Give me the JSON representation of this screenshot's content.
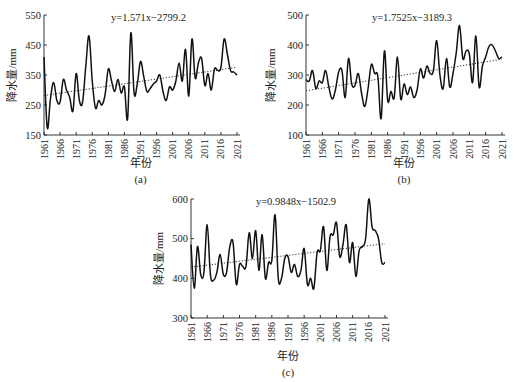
{
  "chart_data": [
    {
      "id": "a",
      "type": "line",
      "caption": "(a)",
      "equation": "y=1.571x−2799.2",
      "xlabel": "年份",
      "ylabel": "降水量/mm",
      "xlim": [
        1961,
        2021
      ],
      "ylim": [
        150,
        550
      ],
      "yticks": [
        150,
        250,
        350,
        450,
        550
      ],
      "xticks": [
        1961,
        1966,
        1971,
        1976,
        1981,
        1986,
        1991,
        1996,
        2001,
        2006,
        2011,
        2016,
        2021
      ],
      "trend": {
        "slope": 1.571,
        "intercept": -2799.2,
        "style": "dotted"
      },
      "x": [
        1961,
        1962,
        1963,
        1964,
        1965,
        1966,
        1967,
        1968,
        1969,
        1970,
        1971,
        1972,
        1973,
        1974,
        1975,
        1976,
        1977,
        1978,
        1979,
        1980,
        1981,
        1982,
        1983,
        1984,
        1985,
        1986,
        1987,
        1988,
        1989,
        1990,
        1991,
        1992,
        1993,
        1994,
        1995,
        1996,
        1997,
        1998,
        1999,
        2000,
        2001,
        2002,
        2003,
        2004,
        2005,
        2006,
        2007,
        2008,
        2009,
        2010,
        2011,
        2012,
        2013,
        2014,
        2015,
        2016,
        2017,
        2018,
        2019,
        2020,
        2021
      ],
      "values": [
        410,
        175,
        270,
        325,
        265,
        260,
        335,
        300,
        275,
        230,
        355,
        265,
        260,
        380,
        480,
        330,
        240,
        265,
        250,
        285,
        370,
        330,
        295,
        335,
        290,
        310,
        205,
        490,
        290,
        320,
        395,
        345,
        295,
        305,
        320,
        330,
        350,
        295,
        265,
        310,
        300,
        330,
        390,
        330,
        435,
        280,
        470,
        340,
        390,
        405,
        315,
        355,
        300,
        370,
        365,
        375,
        470,
        420,
        365,
        360,
        350
      ]
    },
    {
      "id": "b",
      "type": "line",
      "caption": "(b)",
      "equation": "y=1.7525x−3189.3",
      "xlabel": "年份",
      "ylabel": "降水量/mm",
      "xlim": [
        1961,
        2021
      ],
      "ylim": [
        100,
        500
      ],
      "yticks": [
        100,
        200,
        300,
        400,
        500
      ],
      "xticks": [
        1961,
        1966,
        1971,
        1976,
        1981,
        1986,
        1991,
        1996,
        2001,
        2006,
        2011,
        2016,
        2021
      ],
      "trend": {
        "slope": 1.7525,
        "intercept": -3189.3,
        "style": "dotted"
      },
      "x": [
        1961,
        1962,
        1963,
        1964,
        1965,
        1966,
        1967,
        1968,
        1969,
        1970,
        1971,
        1972,
        1973,
        1974,
        1975,
        1976,
        1977,
        1978,
        1979,
        1980,
        1981,
        1982,
        1983,
        1984,
        1985,
        1986,
        1987,
        1988,
        1989,
        1990,
        1991,
        1992,
        1993,
        1994,
        1995,
        1996,
        1997,
        1998,
        1999,
        2000,
        2001,
        2002,
        2003,
        2004,
        2005,
        2006,
        2007,
        2008,
        2009,
        2010,
        2011,
        2012,
        2013,
        2014,
        2015,
        2016,
        2017,
        2018,
        2019,
        2020,
        2021
      ],
      "values": [
        285,
        280,
        315,
        255,
        280,
        275,
        315,
        260,
        220,
        250,
        310,
        315,
        225,
        355,
        270,
        265,
        305,
        240,
        195,
        255,
        335,
        305,
        295,
        155,
        380,
        215,
        245,
        225,
        360,
        220,
        270,
        235,
        260,
        225,
        250,
        320,
        290,
        330,
        305,
        315,
        415,
        300,
        255,
        355,
        260,
        305,
        375,
        465,
        355,
        380,
        370,
        275,
        430,
        260,
        330,
        360,
        395,
        400,
        380,
        355,
        360
      ]
    },
    {
      "id": "c",
      "type": "line",
      "caption": "(c)",
      "equation": "y=0.9848x−1502.9",
      "xlabel": "年份",
      "ylabel": "降水量/mm",
      "xlim": [
        1961,
        2021
      ],
      "ylim": [
        300,
        600
      ],
      "yticks": [
        300,
        400,
        500,
        600
      ],
      "xticks": [
        1961,
        1966,
        1971,
        1976,
        1981,
        1986,
        1991,
        1996,
        2001,
        2006,
        2011,
        2016,
        2021
      ],
      "trend": {
        "slope": 0.9848,
        "intercept": -1502.9,
        "style": "dotted"
      },
      "x": [
        1961,
        1962,
        1963,
        1964,
        1965,
        1966,
        1967,
        1968,
        1969,
        1970,
        1971,
        1972,
        1973,
        1974,
        1975,
        1976,
        1977,
        1978,
        1979,
        1980,
        1981,
        1982,
        1983,
        1984,
        1985,
        1986,
        1987,
        1988,
        1989,
        1990,
        1991,
        1992,
        1993,
        1994,
        1995,
        1996,
        1997,
        1998,
        1999,
        2000,
        2001,
        2002,
        2003,
        2004,
        2005,
        2006,
        2007,
        2008,
        2009,
        2010,
        2011,
        2012,
        2013,
        2014,
        2015,
        2016,
        2017,
        2018,
        2019,
        2020,
        2021
      ],
      "values": [
        485,
        375,
        480,
        410,
        415,
        535,
        410,
        395,
        415,
        460,
        410,
        415,
        480,
        490,
        385,
        435,
        430,
        430,
        515,
        450,
        520,
        420,
        510,
        400,
        440,
        445,
        560,
        400,
        400,
        450,
        455,
        415,
        435,
        405,
        420,
        475,
        385,
        400,
        375,
        465,
        470,
        530,
        420,
        505,
        510,
        540,
        455,
        485,
        535,
        440,
        490,
        405,
        470,
        480,
        500,
        600,
        530,
        520,
        500,
        440,
        440
      ]
    }
  ],
  "panels": {
    "a": {
      "caption": "(a)",
      "equation": "y=1.571x−2799.2",
      "xlabel": "年份",
      "ylabel": "降水量/mm"
    },
    "b": {
      "caption": "(b)",
      "equation": "y=1.7525x−3189.3",
      "xlabel": "年份",
      "ylabel": "降水量/mm"
    },
    "c": {
      "caption": "(c)",
      "equation": "y=0.9848x−1502.9",
      "xlabel": "年份",
      "ylabel": "降水量/mm"
    }
  },
  "colors": {
    "line": "#111111",
    "trend": "#333333",
    "axis": "#333333"
  }
}
